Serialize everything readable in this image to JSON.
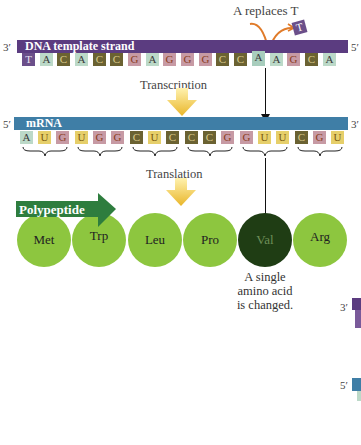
{
  "mutation_label": "A replaces T",
  "removed_base": "T",
  "dna": {
    "label": "DNA template strand",
    "left_end": "3′",
    "right_end": "5′",
    "bar_color": "#5b3c80",
    "bases": [
      "T",
      "A",
      "C",
      "A",
      "C",
      "C",
      "G",
      "A",
      "G",
      "G",
      "G",
      "C",
      "C",
      "A",
      "A",
      "G",
      "C",
      "A"
    ],
    "mutated_index": 13
  },
  "transcription_label": "Transcription",
  "mrna": {
    "label": "mRNA",
    "left_end": "5′",
    "right_end": "3′",
    "bar_color": "#3f7ea6",
    "bases": [
      "A",
      "U",
      "G",
      "U",
      "G",
      "G",
      "C",
      "U",
      "C",
      "C",
      "C",
      "G",
      "G",
      "U",
      "U",
      "C",
      "G",
      "U"
    ]
  },
  "translation_label": "Translation",
  "polypeptide": {
    "label": "Polypeptide",
    "banner_color": "#2e7d3e",
    "amino_acids": [
      "Met",
      "Trp",
      "Leu",
      "Pro",
      "Val",
      "Arg"
    ],
    "changed_index": 4
  },
  "annotation": {
    "line1": "A single",
    "line2": "amino acid",
    "line3": "is changed."
  },
  "partial_right": {
    "top_end": "3′",
    "bottom_end": "5′"
  },
  "base_colors": {
    "A": "#bcd9c8",
    "T": "#6b4f8a",
    "C": "#6b6232",
    "G": "#c79aa4",
    "U": "#e6cf6a"
  }
}
